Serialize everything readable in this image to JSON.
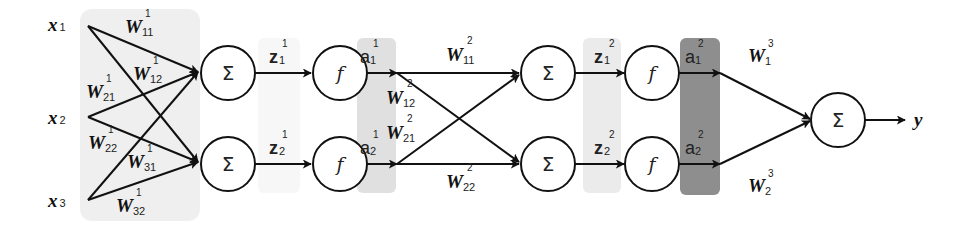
{
  "diagram": {
    "colors": {
      "input_panel": "#efefef",
      "a1_band": "#e2e2e2",
      "z2_band": "#ececec",
      "a2_band": "#8f8f8f",
      "z1_faint": "#f6f6f6",
      "stroke": "#111111"
    },
    "inputs": [
      {
        "base": "x",
        "sub": "1"
      },
      {
        "base": "x",
        "sub": "2"
      },
      {
        "base": "x",
        "sub": "3"
      }
    ],
    "layer1_weights": [
      {
        "base": "W",
        "sub": "11",
        "sup": "1"
      },
      {
        "base": "W",
        "sub": "12",
        "sup": "1"
      },
      {
        "base": "W",
        "sub": "21",
        "sup": "1"
      },
      {
        "base": "W",
        "sub": "22",
        "sup": "1"
      },
      {
        "base": "W",
        "sub": "31",
        "sup": "1"
      },
      {
        "base": "W",
        "sub": "32",
        "sup": "1"
      }
    ],
    "layer1": {
      "sum_symbol": "Σ",
      "activation_symbol": "f",
      "z": [
        {
          "base": "z",
          "sub": "1",
          "sup": "1"
        },
        {
          "base": "z",
          "sub": "2",
          "sup": "1"
        }
      ],
      "a": [
        {
          "base": "a",
          "sub": "1",
          "sup": "1"
        },
        {
          "base": "a",
          "sub": "2",
          "sup": "1"
        }
      ]
    },
    "layer2_weights": [
      {
        "base": "W",
        "sub": "11",
        "sup": "2"
      },
      {
        "base": "W",
        "sub": "12",
        "sup": "2"
      },
      {
        "base": "W",
        "sub": "21",
        "sup": "2"
      },
      {
        "base": "W",
        "sub": "22",
        "sup": "2"
      }
    ],
    "layer2": {
      "sum_symbol": "Σ",
      "activation_symbol": "f",
      "z": [
        {
          "base": "z",
          "sub": "1",
          "sup": "2"
        },
        {
          "base": "z",
          "sub": "2",
          "sup": "2"
        }
      ],
      "a": [
        {
          "base": "a",
          "sub": "1",
          "sup": "2"
        },
        {
          "base": "a",
          "sub": "2",
          "sup": "2"
        }
      ]
    },
    "layer3_weights": [
      {
        "base": "W",
        "sub": "1",
        "sup": "3"
      },
      {
        "base": "W",
        "sub": "2",
        "sup": "3"
      }
    ],
    "output": {
      "sum_symbol": "Σ",
      "label": "y"
    }
  }
}
